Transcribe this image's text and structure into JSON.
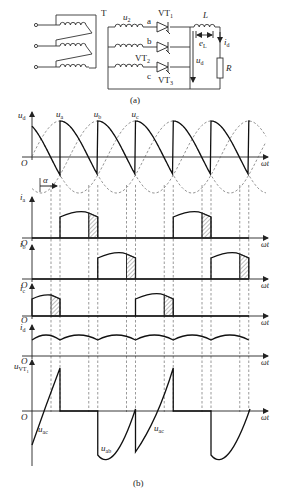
{
  "circuit": {
    "caption": "(a)",
    "transformer_label": "T",
    "secondary_label": "u",
    "secondary_sub": "2",
    "phases": [
      {
        "name": "a",
        "thyristor": "VT",
        "thyristor_sub": "1"
      },
      {
        "name": "b",
        "thyristor": "VT",
        "thyristor_sub": "2"
      },
      {
        "name": "c",
        "thyristor": "VT",
        "thyristor_sub": "3"
      }
    ],
    "inductor_label": "L",
    "emf_label": "e",
    "emf_sub": "L",
    "current_label": "i",
    "current_sub": "d",
    "voltage_label": "u",
    "voltage_sub": "d",
    "resistor_label": "R"
  },
  "waveforms": {
    "caption": "(b)",
    "x_axis_label": "ωt",
    "origin_label": "O",
    "alpha_label": "α",
    "panels": [
      {
        "id": "ud",
        "label": "u",
        "sub": "d"
      },
      {
        "id": "ia",
        "label": "i",
        "sub": "a"
      },
      {
        "id": "ib",
        "label": "i",
        "sub": "b"
      },
      {
        "id": "ic",
        "label": "i",
        "sub": "c"
      },
      {
        "id": "id",
        "label": "i",
        "sub": "d"
      },
      {
        "id": "uvt1",
        "label": "u",
        "sub": "VT",
        "subsub": "1"
      }
    ],
    "phase_labels": [
      {
        "label": "u",
        "sub": "a"
      },
      {
        "label": "u",
        "sub": "b"
      },
      {
        "label": "u",
        "sub": "c"
      }
    ],
    "uvt_annotations": [
      {
        "label": "u",
        "sub": "ac"
      },
      {
        "label": "u",
        "sub": "ab"
      },
      {
        "label": "u",
        "sub": "ac"
      }
    ]
  },
  "chart_data": {
    "type": "line",
    "xlabel": "ωt",
    "series": [
      {
        "name": "u_d",
        "description": "Output voltage, segments of phase voltages after firing angle α, going negative before commutation"
      },
      {
        "name": "i_a",
        "description": "Phase a thyristor current, 120° conduction blocks with hatched overlap region"
      },
      {
        "name": "i_b",
        "description": "Phase b thyristor current, shifted 120°"
      },
      {
        "name": "i_c",
        "description": "Phase c thyristor current, shifted 240°"
      },
      {
        "name": "i_d",
        "description": "Continuous load current with small ripple"
      },
      {
        "name": "u_VT1",
        "description": "Voltage across VT1: zero while conducting, u_ab and u_ac segments otherwise"
      }
    ],
    "annotations": [
      "u_a",
      "u_b",
      "u_c",
      "α",
      "u_ac",
      "u_ab",
      "u_ac"
    ],
    "grid": false
  }
}
